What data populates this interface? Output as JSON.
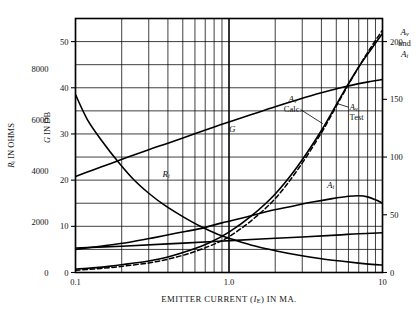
{
  "chart_data": {
    "type": "line",
    "title": "",
    "xlabel": "EMITTER CURRENT (I_E) IN MA.",
    "xlabel_parts": {
      "pre": "EMITTER CURRENT (",
      "italic": "I",
      "sub": "E",
      "post": ") IN MA."
    },
    "xscale": "log",
    "xlim": [
      0.1,
      10
    ],
    "xticks": [
      0.1,
      1.0,
      10
    ],
    "xticklabels": [
      "0.1",
      "1.0",
      "10"
    ],
    "grid": true,
    "axes": [
      {
        "id": "left-outer",
        "name": "R_i IN OHMS",
        "label_parts": {
          "italic": "R",
          "sub": "i",
          "post": " IN OHMS"
        },
        "ticks": [
          0,
          2000,
          4000,
          6000,
          8000
        ],
        "ticklabels": [
          "0",
          "2000",
          "4000",
          "6000",
          "8000"
        ],
        "lim": [
          0,
          10000
        ]
      },
      {
        "id": "left-inner",
        "name": "G IN DB",
        "label_parts": {
          "italic": "G",
          "post": " IN DB"
        },
        "ticks": [
          0,
          10,
          20,
          30,
          40,
          50
        ],
        "ticklabels": [
          "0",
          "10",
          "20",
          "30",
          "40",
          "50"
        ],
        "lim": [
          0,
          55
        ]
      },
      {
        "id": "right",
        "name": "A_v and A_i",
        "label_lines": [
          "A",
          "and",
          "A"
        ],
        "ticks": [
          0,
          50,
          100,
          150,
          200
        ],
        "ticklabels": [
          "0",
          "50",
          "100",
          "150",
          "200"
        ],
        "lim": [
          0,
          220
        ]
      }
    ],
    "series": [
      {
        "name": "G",
        "label": "G",
        "style": "solid",
        "axis": "left-inner",
        "label_pos": {
          "x": 1.05,
          "y": 30.5
        },
        "points": [
          [
            0.1,
            20.8
          ],
          [
            0.13,
            22.2
          ],
          [
            0.17,
            23.6
          ],
          [
            0.22,
            25.0
          ],
          [
            0.3,
            26.6
          ],
          [
            0.4,
            28.0
          ],
          [
            0.55,
            29.6
          ],
          [
            0.75,
            31.2
          ],
          [
            1.0,
            32.6
          ],
          [
            1.4,
            34.2
          ],
          [
            2.0,
            35.9
          ],
          [
            2.8,
            37.4
          ],
          [
            4.0,
            38.9
          ],
          [
            5.5,
            40.1
          ],
          [
            7.0,
            40.9
          ],
          [
            8.5,
            41.4
          ],
          [
            10.0,
            41.8
          ]
        ]
      },
      {
        "name": "R_i",
        "label": "R",
        "label_sub": "i",
        "style": "solid",
        "axis": "left-outer",
        "label_pos": {
          "x": 0.39,
          "y": 3750
        },
        "points": [
          [
            0.1,
            7000
          ],
          [
            0.12,
            6000
          ],
          [
            0.15,
            5150
          ],
          [
            0.19,
            4350
          ],
          [
            0.24,
            3650
          ],
          [
            0.3,
            3120
          ],
          [
            0.38,
            2650
          ],
          [
            0.5,
            2200
          ],
          [
            0.65,
            1820
          ],
          [
            0.85,
            1500
          ],
          [
            1.1,
            1270
          ],
          [
            1.5,
            1030
          ],
          [
            2.0,
            860
          ],
          [
            2.8,
            690
          ],
          [
            4.0,
            540
          ],
          [
            5.5,
            440
          ],
          [
            7.0,
            370
          ],
          [
            8.5,
            320
          ],
          [
            10.0,
            290
          ]
        ]
      },
      {
        "name": "A_v Calc.",
        "label_lines": [
          "A",
          "Calc."
        ],
        "label_italic": "A",
        "label_sub": "v",
        "style": "solid",
        "axis": "right",
        "label_pos": {
          "x": 2.6,
          "y": 148
        },
        "points": [
          [
            0.1,
            3
          ],
          [
            0.13,
            4
          ],
          [
            0.17,
            5.5
          ],
          [
            0.22,
            7.5
          ],
          [
            0.3,
            10
          ],
          [
            0.4,
            13.5
          ],
          [
            0.55,
            19
          ],
          [
            0.75,
            26
          ],
          [
            1.0,
            35
          ],
          [
            1.4,
            49
          ],
          [
            2.0,
            68
          ],
          [
            2.8,
            92
          ],
          [
            4.0,
            123
          ],
          [
            5.5,
            155
          ],
          [
            7.0,
            178
          ],
          [
            8.5,
            194
          ],
          [
            10.0,
            207
          ]
        ]
      },
      {
        "name": "A_v Test",
        "label_lines": [
          "A",
          "Test"
        ],
        "label_italic": "A",
        "label_sub": "v",
        "style": "dashed",
        "axis": "right",
        "label_pos": {
          "x": 6.1,
          "y": 141
        },
        "points": [
          [
            0.1,
            2
          ],
          [
            0.13,
            3
          ],
          [
            0.17,
            4.3
          ],
          [
            0.22,
            6
          ],
          [
            0.3,
            8.3
          ],
          [
            0.4,
            11.5
          ],
          [
            0.55,
            16.5
          ],
          [
            0.75,
            23
          ],
          [
            1.0,
            31
          ],
          [
            1.4,
            45
          ],
          [
            2.0,
            64
          ],
          [
            2.8,
            89
          ],
          [
            4.0,
            121
          ],
          [
            5.5,
            154
          ],
          [
            7.0,
            178
          ],
          [
            8.5,
            196
          ],
          [
            10.0,
            210
          ]
        ]
      },
      {
        "name": "A_i",
        "label": "A",
        "label_sub": "i",
        "style": "solid",
        "axis": "right",
        "label_pos": {
          "x": 4.6,
          "y": 73
        },
        "points": [
          [
            0.1,
            20
          ],
          [
            0.15,
            23
          ],
          [
            0.22,
            26
          ],
          [
            0.32,
            30
          ],
          [
            0.45,
            34
          ],
          [
            0.65,
            38
          ],
          [
            0.9,
            43
          ],
          [
            1.3,
            48
          ],
          [
            1.8,
            53
          ],
          [
            2.5,
            57
          ],
          [
            3.5,
            61
          ],
          [
            4.7,
            64
          ],
          [
            6.0,
            66
          ],
          [
            7.0,
            66.5
          ],
          [
            8.0,
            65.5
          ],
          [
            9.0,
            63
          ],
          [
            10.0,
            60
          ]
        ]
      },
      {
        "name": "R_i-secondary-flat",
        "label": "",
        "style": "solid",
        "axis": "left-inner",
        "label_pos": null,
        "points": [
          [
            0.1,
            5.3
          ],
          [
            0.2,
            5.7
          ],
          [
            0.4,
            6.2
          ],
          [
            0.8,
            6.7
          ],
          [
            1.5,
            7.2
          ],
          [
            3.0,
            7.7
          ],
          [
            5.0,
            8.1
          ],
          [
            7.0,
            8.4
          ],
          [
            10.0,
            8.6
          ]
        ]
      }
    ]
  }
}
